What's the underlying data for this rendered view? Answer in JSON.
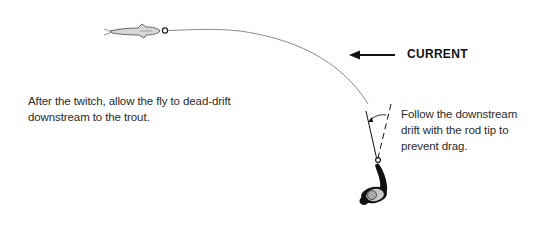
{
  "diagram": {
    "current_label": "CURRENT",
    "left_caption": {
      "lines": [
        "After the twitch, allow the fly to dead-drift",
        "downstream to the trout."
      ]
    },
    "right_caption": {
      "lines": [
        "Follow the downstream",
        "drift with the rod tip to",
        "prevent drag."
      ]
    },
    "elements": {
      "trout": "trout-icon",
      "fly": "fly-marker",
      "fly_line": "fly-line-curve",
      "current_arrow": "left-arrow-icon",
      "rod_current": "rod-solid-line",
      "rod_previous": "rod-dashed-line",
      "rod_angle": "angle-arc",
      "angler": "angler-figure"
    },
    "colors": {
      "line": "#8a8a8a",
      "ink": "#111111",
      "fish_fill": "#d8d8d8",
      "text": "#2a2a2a"
    }
  }
}
